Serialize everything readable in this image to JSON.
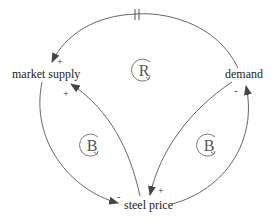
{
  "diagram": {
    "type": "causal loop diagram",
    "nodes": [
      {
        "id": "market_supply",
        "label": "market supply"
      },
      {
        "id": "demand",
        "label": "demand"
      },
      {
        "id": "steel_price",
        "label": "steel price"
      }
    ],
    "links": [
      {
        "from": "demand",
        "to": "market_supply",
        "polarity": "+",
        "delay": true
      },
      {
        "from": "market_supply",
        "to": "steel_price",
        "polarity": "-"
      },
      {
        "from": "steel_price",
        "to": "market_supply",
        "polarity": "+"
      },
      {
        "from": "demand",
        "to": "steel_price",
        "polarity": "+"
      },
      {
        "from": "steel_price",
        "to": "demand",
        "polarity": "-"
      }
    ],
    "loops": [
      {
        "id": "R",
        "label": "R",
        "type": "reinforcing"
      },
      {
        "id": "B1",
        "label": "B",
        "type": "balancing"
      },
      {
        "id": "B2",
        "label": "B",
        "type": "balancing"
      }
    ],
    "delay_mark": "||",
    "colors": {
      "line": "#555555",
      "text": "#222222"
    }
  }
}
